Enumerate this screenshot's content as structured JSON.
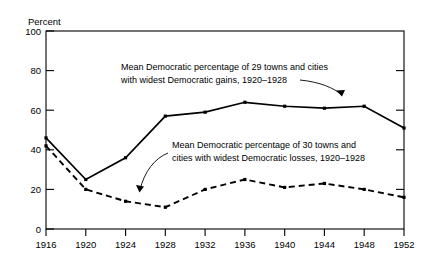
{
  "chart_data": {
    "type": "line",
    "title": "",
    "xlabel": "",
    "ylabel": "Percent",
    "x": [
      1916,
      1920,
      1924,
      1928,
      1932,
      1936,
      1940,
      1944,
      1948,
      1952
    ],
    "xtick_labels": [
      "1916",
      "1920",
      "1924",
      "1928",
      "1932",
      "1936",
      "1940",
      "1944",
      "1948",
      "1952"
    ],
    "ytick_labels": [
      "0",
      "20",
      "40",
      "60",
      "80",
      "100"
    ],
    "yticks": [
      0,
      20,
      40,
      60,
      80,
      100
    ],
    "ylim": [
      0,
      100
    ],
    "xlim": [
      1916,
      1952
    ],
    "grid": false,
    "legend_position": "inline-annotations",
    "series": [
      {
        "name": "Mean Democratic percentage of 29 towns and cities with widest Democratic gains, 1920–1928",
        "style": "solid",
        "values": [
          46,
          25,
          36,
          57,
          59,
          64,
          62,
          61,
          62,
          51
        ]
      },
      {
        "name": "Mean Democratic percentage of 30 towns and cities with widest Democratic losses, 1920–1928",
        "style": "dashed",
        "values": [
          42,
          20,
          14,
          11,
          20,
          25,
          21,
          23,
          20,
          16
        ]
      }
    ],
    "annotations": [
      {
        "id": "gains",
        "line1": "Mean Democratic percentage of 29 towns and cities",
        "line2": "with widest Democratic gains, 1920–1928"
      },
      {
        "id": "losses",
        "line1": "Mean Democratic percentage of 30 towns and",
        "line2": "cities with widest Democratic losses, 1920–1928"
      }
    ]
  },
  "axis": {
    "y_label": "Percent",
    "y_ticks": [
      "100",
      "80",
      "60",
      "40",
      "20",
      "0"
    ],
    "x_ticks": [
      "1916",
      "1920",
      "1924",
      "1928",
      "1932",
      "1936",
      "1940",
      "1944",
      "1948",
      "1952"
    ]
  },
  "annotations": {
    "gains_line1": "Mean Democratic percentage of 29 towns and cities",
    "gains_line2": "with widest Democratic gains, 1920–1928",
    "losses_line1": "Mean Democratic percentage of 30 towns and",
    "losses_line2": "cities with widest Democratic losses, 1920–1928"
  }
}
